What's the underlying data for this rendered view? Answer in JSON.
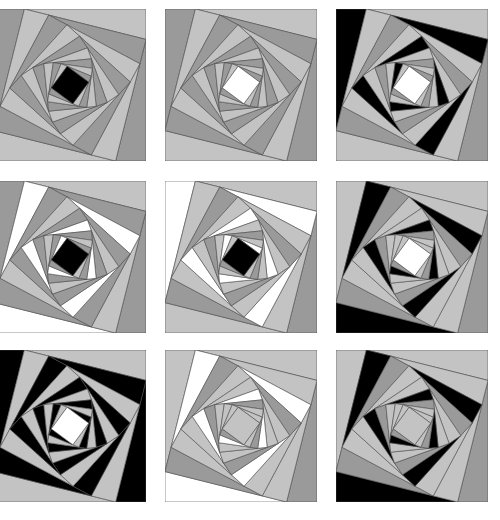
{
  "puzzle": {
    "rows": 3,
    "cols": 3,
    "palette": {
      "light": "#c3c3c3",
      "dark": "#9a9a9a",
      "black": "#000000",
      "white": "#ffffff",
      "line": "#4a4a4a"
    },
    "tiles": [
      {
        "id": "r1c1",
        "x": -6,
        "y": 9,
        "center": "black",
        "arms": [
          "light",
          "dark",
          "light",
          "dark"
        ],
        "overrides": []
      },
      {
        "id": "r1c2",
        "x": 165,
        "y": 9,
        "center": "white",
        "arms": [
          "light",
          "dark",
          "light",
          "dark"
        ],
        "overrides": []
      },
      {
        "id": "r1c3",
        "x": 336,
        "y": 9,
        "center": "white",
        "arms": [
          "light",
          "dark",
          "light",
          "dark"
        ],
        "overrides": [
          {
            "arm": 3,
            "from": 0,
            "to": 7,
            "color": "black"
          }
        ]
      },
      {
        "id": "r2c1",
        "x": -6,
        "y": 181,
        "center": "black",
        "arms": [
          "light",
          "dark",
          "light",
          "dark"
        ],
        "overrides": [
          {
            "arm": 2,
            "from": 0,
            "to": 8,
            "color": "white"
          }
        ]
      },
      {
        "id": "r2c2",
        "x": 165,
        "y": 181,
        "center": "black",
        "arms": [
          "light",
          "dark",
          "light",
          "dark"
        ],
        "overrides": [
          {
            "arm": 3,
            "from": 0,
            "to": 8,
            "color": "white"
          }
        ]
      },
      {
        "id": "r2c3",
        "x": 336,
        "y": 181,
        "center": "white",
        "arms": [
          "light",
          "dark",
          "light",
          "light"
        ],
        "overrides": [
          {
            "arm": 2,
            "from": 0,
            "to": 7,
            "color": "black"
          }
        ]
      },
      {
        "id": "r3c1",
        "x": -6,
        "y": 350,
        "center": "white",
        "arms": [
          "light",
          "dark",
          "light",
          "dark"
        ],
        "overrides": [
          {
            "arm": 3,
            "from": 0,
            "to": 8,
            "color": "black"
          },
          {
            "arm": 1,
            "from": 0,
            "to": 8,
            "color": "black"
          }
        ]
      },
      {
        "id": "r3c2",
        "x": 165,
        "y": 350,
        "center": "light",
        "arms": [
          "light",
          "dark",
          "light",
          "light"
        ],
        "overrides": [
          {
            "arm": 2,
            "from": 0,
            "to": 7,
            "color": "white"
          }
        ]
      },
      {
        "id": "r3c3",
        "x": 336,
        "y": 350,
        "center": "light",
        "arms": [
          "light",
          "dark",
          "light",
          "light"
        ],
        "overrides": [
          {
            "arm": 2,
            "from": 0,
            "to": 7,
            "color": "black"
          }
        ]
      }
    ],
    "geometry": {
      "levels": 9,
      "ratio": 0.2
    }
  }
}
